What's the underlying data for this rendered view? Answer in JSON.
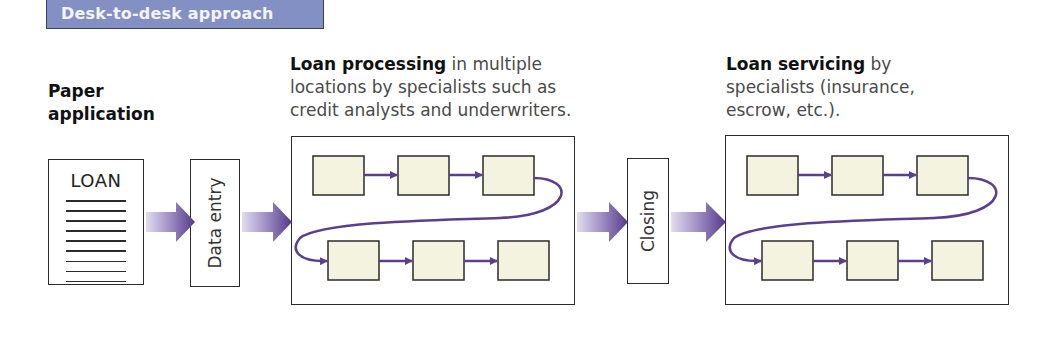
{
  "header": {
    "title": "Desk-to-desk approach",
    "color": "#8390c4"
  },
  "stages": {
    "paper_application": {
      "title": "Paper application",
      "document_label": "LOAN",
      "line_count": 9
    },
    "data_entry": {
      "label": "Data entry"
    },
    "loan_processing": {
      "title_bold": "Loan processing",
      "title_rest": " in multiple",
      "description_lines": [
        "locations by specialists such as",
        "credit analysts and underwriters."
      ],
      "step_count": 6
    },
    "closing": {
      "label": "Closing"
    },
    "loan_servicing": {
      "title_bold": "Loan servicing",
      "title_rest": " by",
      "description_lines": [
        "specialists (insurance,",
        "escrow, etc.)."
      ],
      "step_count": 6
    }
  },
  "colors": {
    "arrow_start": "#d9d3ea",
    "arrow_end": "#5a3f8f",
    "connector": "#5b3f8e",
    "step_fill": "#f3f3e0",
    "border": "#2b2b2b"
  }
}
